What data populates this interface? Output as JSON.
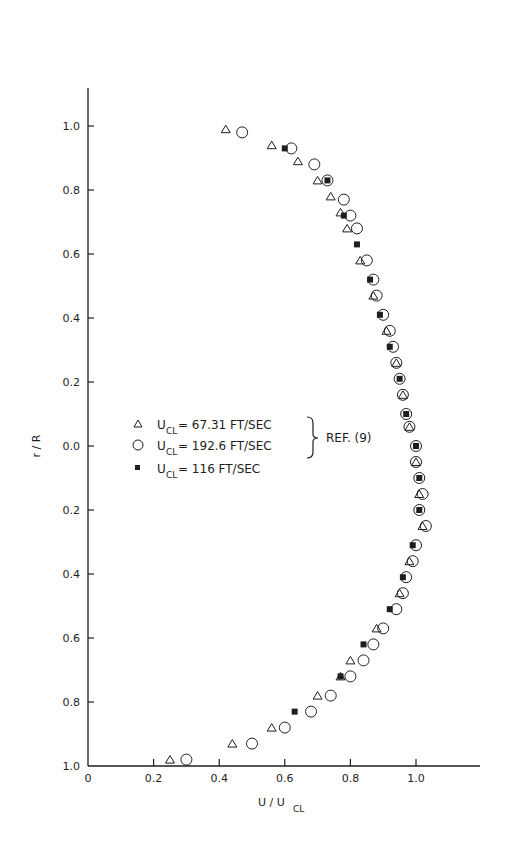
{
  "chart_data": {
    "type": "scatter",
    "title": "",
    "xlabel": "U/U_CL",
    "ylabel": "r/R",
    "xlim": [
      0,
      1.2
    ],
    "ylim_top_half": [
      0,
      1.1
    ],
    "ylim_bottom_half": [
      0,
      1.0
    ],
    "x_ticks": [
      "0",
      "0.2",
      "0.4",
      "0.6",
      "0.8",
      "1.0"
    ],
    "y_ticks_upper": [
      "1.0",
      "0.8",
      "0.6",
      "0.4",
      "0.2",
      "0.0"
    ],
    "y_ticks_lower": [
      "0.2",
      "0.4",
      "0.6",
      "0.8",
      "1.0"
    ],
    "grid": false,
    "legend_position": "center-left",
    "note": "Upper half of the plot is r/R above centerline (positive side), lower half is r/R below centerline; both axes labeled with magnitudes.",
    "series": [
      {
        "name": "U_CL = 67.31 FT/SEC",
        "marker": "triangle-open",
        "group": "REF. (9)",
        "points": [
          {
            "u": 0.42,
            "r": 0.99
          },
          {
            "u": 0.56,
            "r": 0.94
          },
          {
            "u": 0.64,
            "r": 0.89
          },
          {
            "u": 0.7,
            "r": 0.83
          },
          {
            "u": 0.74,
            "r": 0.78
          },
          {
            "u": 0.77,
            "r": 0.73
          },
          {
            "u": 0.79,
            "r": 0.68
          },
          {
            "u": 0.83,
            "r": 0.58
          },
          {
            "u": 0.87,
            "r": 0.47
          },
          {
            "u": 0.91,
            "r": 0.36
          },
          {
            "u": 0.94,
            "r": 0.26
          },
          {
            "u": 0.96,
            "r": 0.16
          },
          {
            "u": 0.98,
            "r": 0.06
          },
          {
            "u": 1.0,
            "r": -0.05
          },
          {
            "u": 1.01,
            "r": -0.15
          },
          {
            "u": 1.02,
            "r": -0.25
          },
          {
            "u": 0.98,
            "r": -0.36
          },
          {
            "u": 0.95,
            "r": -0.46
          },
          {
            "u": 0.88,
            "r": -0.57
          },
          {
            "u": 0.8,
            "r": -0.67
          },
          {
            "u": 0.77,
            "r": -0.72
          },
          {
            "u": 0.7,
            "r": -0.78
          },
          {
            "u": 0.56,
            "r": -0.88
          },
          {
            "u": 0.44,
            "r": -0.93
          },
          {
            "u": 0.25,
            "r": -0.98
          }
        ]
      },
      {
        "name": "U_CL = 192.6 FT/SEC",
        "marker": "circle-open",
        "group": "REF. (9)",
        "points": [
          {
            "u": 0.47,
            "r": 0.98
          },
          {
            "u": 0.62,
            "r": 0.93
          },
          {
            "u": 0.69,
            "r": 0.88
          },
          {
            "u": 0.73,
            "r": 0.83
          },
          {
            "u": 0.78,
            "r": 0.77
          },
          {
            "u": 0.8,
            "r": 0.72
          },
          {
            "u": 0.82,
            "r": 0.68
          },
          {
            "u": 0.85,
            "r": 0.58
          },
          {
            "u": 0.87,
            "r": 0.52
          },
          {
            "u": 0.88,
            "r": 0.47
          },
          {
            "u": 0.9,
            "r": 0.41
          },
          {
            "u": 0.92,
            "r": 0.36
          },
          {
            "u": 0.93,
            "r": 0.31
          },
          {
            "u": 0.94,
            "r": 0.26
          },
          {
            "u": 0.95,
            "r": 0.21
          },
          {
            "u": 0.96,
            "r": 0.16
          },
          {
            "u": 0.97,
            "r": 0.1
          },
          {
            "u": 0.98,
            "r": 0.06
          },
          {
            "u": 1.0,
            "r": 0.0
          },
          {
            "u": 1.0,
            "r": -0.05
          },
          {
            "u": 1.01,
            "r": -0.1
          },
          {
            "u": 1.02,
            "r": -0.15
          },
          {
            "u": 1.01,
            "r": -0.2
          },
          {
            "u": 1.03,
            "r": -0.25
          },
          {
            "u": 1.0,
            "r": -0.31
          },
          {
            "u": 0.99,
            "r": -0.36
          },
          {
            "u": 0.97,
            "r": -0.41
          },
          {
            "u": 0.96,
            "r": -0.46
          },
          {
            "u": 0.94,
            "r": -0.51
          },
          {
            "u": 0.9,
            "r": -0.57
          },
          {
            "u": 0.87,
            "r": -0.62
          },
          {
            "u": 0.84,
            "r": -0.67
          },
          {
            "u": 0.8,
            "r": -0.72
          },
          {
            "u": 0.74,
            "r": -0.78
          },
          {
            "u": 0.68,
            "r": -0.83
          },
          {
            "u": 0.6,
            "r": -0.88
          },
          {
            "u": 0.5,
            "r": -0.93
          },
          {
            "u": 0.3,
            "r": -0.98
          }
        ]
      },
      {
        "name": "U_CL = 116 FT/SEC",
        "marker": "square-filled",
        "points": [
          {
            "u": 0.6,
            "r": 0.93
          },
          {
            "u": 0.73,
            "r": 0.83
          },
          {
            "u": 0.78,
            "r": 0.72
          },
          {
            "u": 0.82,
            "r": 0.63
          },
          {
            "u": 0.86,
            "r": 0.52
          },
          {
            "u": 0.89,
            "r": 0.41
          },
          {
            "u": 0.92,
            "r": 0.31
          },
          {
            "u": 0.95,
            "r": 0.21
          },
          {
            "u": 0.97,
            "r": 0.1
          },
          {
            "u": 1.0,
            "r": 0.0
          },
          {
            "u": 1.01,
            "r": -0.1
          },
          {
            "u": 1.01,
            "r": -0.2
          },
          {
            "u": 0.99,
            "r": -0.31
          },
          {
            "u": 0.96,
            "r": -0.41
          },
          {
            "u": 0.92,
            "r": -0.51
          },
          {
            "u": 0.84,
            "r": -0.62
          },
          {
            "u": 0.77,
            "r": -0.72
          },
          {
            "u": 0.63,
            "r": -0.83
          }
        ]
      }
    ]
  },
  "legend": {
    "items": [
      {
        "sym": "U",
        "sub": "CL",
        "text": "= 67.31 FT/SEC"
      },
      {
        "sym": "U",
        "sub": "CL",
        "text": "= 192.6 FT/SEC"
      },
      {
        "sym": "U",
        "sub": "CL",
        "text": "= 116 FT/SEC"
      }
    ],
    "bracket_label": "REF. (9)"
  },
  "axes": {
    "ylabel": "r / R",
    "xlabel_main": "U / U",
    "xlabel_sub": "CL"
  }
}
